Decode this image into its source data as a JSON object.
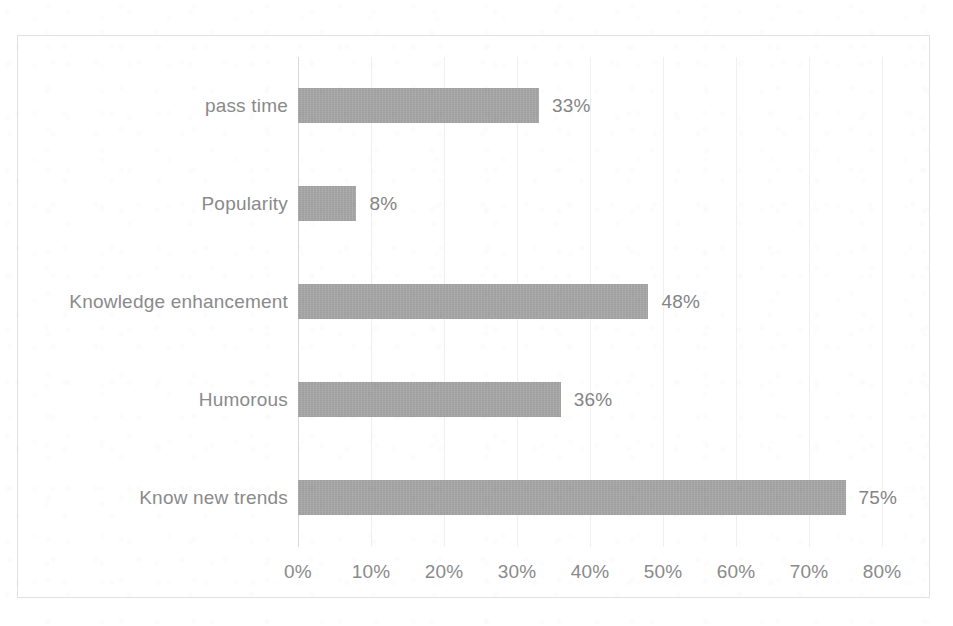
{
  "chart_data": {
    "type": "bar",
    "orientation": "horizontal",
    "title": "",
    "subtitle": "",
    "xlabel": "",
    "ylabel": "",
    "categories": [
      "pass time",
      "Popularity",
      "Knowledge enhancement",
      "Humorous",
      "Know new trends"
    ],
    "values": [
      33,
      8,
      48,
      36,
      75
    ],
    "data_labels": [
      "33%",
      "8%",
      "48%",
      "36%",
      "75%"
    ],
    "xlim": [
      0,
      80
    ],
    "xtick_values": [
      0,
      10,
      20,
      30,
      40,
      50,
      60,
      70,
      80
    ],
    "xtick_labels": [
      "0%",
      "10%",
      "20%",
      "30%",
      "40%",
      "50%",
      "60%",
      "70%",
      "80%"
    ],
    "grid": "vertical-only",
    "legend": "none",
    "series": [
      {
        "name": "",
        "values": [
          33,
          8,
          48,
          36,
          75
        ]
      }
    ],
    "colors": {
      "bar": "#a5a5a5",
      "gridline": "#f0f0f0",
      "axis_line": "#d9d9d9",
      "plot_border": "#e2e2e2",
      "tick_label_text": "#8a8a8a",
      "data_label_text": "#848484",
      "background": "#ffffff"
    }
  }
}
